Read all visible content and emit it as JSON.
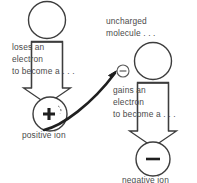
{
  "diagram": {
    "stroke_color": "#3d3d3d",
    "text_color": "#4a4a4a",
    "background": "#ffffff",
    "left_branch": {
      "start_shape_name": "neutral-atom-circle",
      "step_text_line1": "loses an",
      "step_text_line2": "electron",
      "step_text_line3": "to become a . . .",
      "result_symbol": "+",
      "result_label": "positive ion"
    },
    "right_branch": {
      "header_line1": "uncharged",
      "header_line2": "molecule . . .",
      "electron_symbol": "−",
      "start_shape_name": "neutral-molecule-circle",
      "step_text_line1": "gains an",
      "step_text_line2": "electron",
      "step_text_line3": "to become a . . .",
      "result_symbol": "−",
      "result_label": "negative ion"
    },
    "transfer_arrow": {
      "name": "electron-transfer-arrow",
      "from": "positive ion",
      "to": "free electron"
    }
  }
}
